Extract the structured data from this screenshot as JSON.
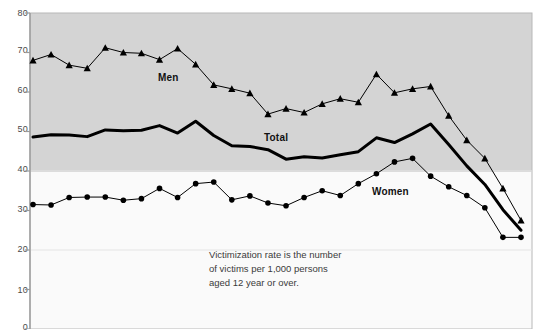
{
  "chart_data": {
    "type": "line",
    "title": "",
    "subtitle": "",
    "xlabel": "",
    "ylabel": "",
    "ylim": [
      0,
      80
    ],
    "yticks": [
      0,
      10,
      20,
      30,
      40,
      50,
      60,
      70,
      80
    ],
    "ytick_labels": [
      "0",
      "10",
      "20",
      "30",
      "40",
      "50",
      "60",
      "70",
      "80"
    ],
    "grid": true,
    "gridlines_at": [
      40,
      20
    ],
    "legend_position": "inline-annotations",
    "x": [
      1,
      2,
      3,
      4,
      5,
      6,
      7,
      8,
      9,
      10,
      11,
      12,
      13,
      14,
      15,
      16,
      17,
      18,
      19,
      20,
      21,
      22,
      23,
      24,
      25,
      26,
      27,
      28
    ],
    "series": [
      {
        "name": "Men",
        "marker": "triangle",
        "line_width": 1,
        "values": [
          68.0,
          69.5,
          66.8,
          66.0,
          71.2,
          70.0,
          69.8,
          68.2,
          71.0,
          67.0,
          61.8,
          60.8,
          59.7,
          54.4,
          55.8,
          54.8,
          57.0,
          58.3,
          57.4,
          64.5,
          59.8,
          60.8,
          61.4,
          54.0,
          47.8,
          43.2,
          35.6,
          27.5
        ]
      },
      {
        "name": "Total",
        "marker": "none",
        "line_width": 3,
        "values": [
          48.6,
          49.2,
          49.1,
          48.7,
          50.4,
          50.2,
          50.3,
          51.5,
          49.6,
          52.6,
          49.0,
          46.4,
          46.2,
          45.4,
          43.0,
          43.6,
          43.3,
          44.1,
          44.9,
          48.4,
          47.2,
          49.4,
          51.9,
          46.7,
          41.3,
          36.6,
          30.2,
          25.0
        ]
      },
      {
        "name": "Women",
        "marker": "circle",
        "line_width": 1,
        "values": [
          31.5,
          31.4,
          33.3,
          33.4,
          33.4,
          32.6,
          33.0,
          35.6,
          33.3,
          36.8,
          37.2,
          32.7,
          33.7,
          31.9,
          31.2,
          33.3,
          35.0,
          33.8,
          36.8,
          39.3,
          42.3,
          43.2,
          38.7,
          36.0,
          33.8,
          30.7,
          23.2,
          23.2
        ]
      }
    ],
    "annotations": [
      {
        "name": "men-label",
        "text": "Men",
        "x_px": 158,
        "y_px": 78
      },
      {
        "name": "total-label",
        "text": "Total",
        "x_px": 264,
        "y_px": 138
      },
      {
        "name": "women-label",
        "text": "Women",
        "x_px": 372,
        "y_px": 192
      }
    ],
    "note_lines": [
      "Victimization rate is the number",
      "of victims per 1,000 persons",
      "aged 12 year or over."
    ],
    "note_text": "Victimization rate is the number\nof victims per 1,000 persons\naged 12 year or over.",
    "colors": {
      "plot_background_upper": "#d4d4d4",
      "plot_background_lower": "#fafafa",
      "line": "#000000",
      "axis": "#9a9a9a",
      "gridline": "#e4e4e4",
      "text": "#3a3a3a"
    }
  }
}
